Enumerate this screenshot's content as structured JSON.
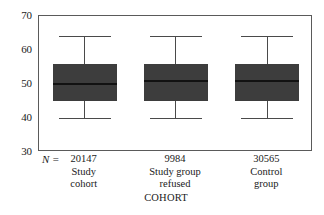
{
  "chart_data": {
    "type": "box",
    "title": "",
    "subtitle": "",
    "xlabel": "COHORT",
    "ylabel": "",
    "ylim": [
      30,
      70
    ],
    "yticks": [
      30,
      40,
      50,
      60,
      70
    ],
    "ytick_labels": [
      "30",
      "40",
      "50",
      "60",
      "70"
    ],
    "grid": false,
    "legend": null,
    "n_prefix_label": "N =",
    "categories": [
      "Study cohort",
      "Study group refused",
      "Control group"
    ],
    "category_label_lines": [
      [
        "Study",
        "cohort"
      ],
      [
        "Study group",
        "refused"
      ],
      [
        "Control",
        "group"
      ]
    ],
    "n_values": [
      "20147",
      "9984",
      "30565"
    ],
    "boxes": [
      {
        "category": "Study cohort",
        "n": "20147",
        "whisker_low": 40,
        "q1": 45,
        "median": 50,
        "q3": 56,
        "whisker_high": 64
      },
      {
        "category": "Study group refused",
        "n": "9984",
        "whisker_low": 40,
        "q1": 45,
        "median": 51,
        "q3": 56,
        "whisker_high": 64
      },
      {
        "category": "Control group",
        "n": "30565",
        "whisker_low": 40,
        "q1": 45,
        "median": 51,
        "q3": 56,
        "whisker_high": 64
      }
    ],
    "colors": {
      "box_fill": "#3d3d3d",
      "median": "#121212",
      "whisker": "#4a4a4a",
      "axis": "#5a5a5a",
      "background": "#ffffff",
      "text": "#1a1a1a"
    }
  }
}
